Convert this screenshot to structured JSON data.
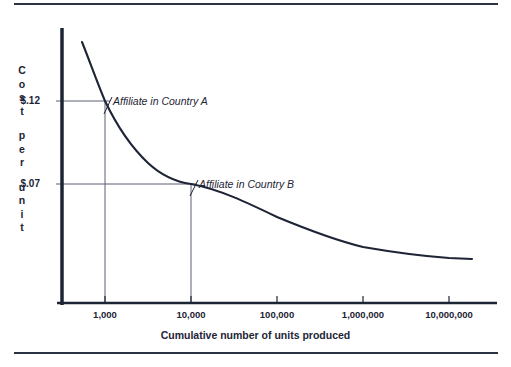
{
  "chart_data": {
    "type": "line",
    "title": "",
    "subtitle": "",
    "xlabel": "Cumulative number of units produced",
    "ylabel": "Cost per unit",
    "ylabel_stacked": [
      "Cost",
      "per",
      "unit"
    ],
    "xscale": "log",
    "x_tick_labels": [
      "1,000",
      "10,000",
      "100,000",
      "1,000,000",
      "10,000,000"
    ],
    "x_tick_values": [
      1000,
      10000,
      100000,
      1000000,
      10000000
    ],
    "y_tick_labels": [
      "$.12",
      "$.07"
    ],
    "y_tick_values": [
      0.12,
      0.07
    ],
    "xlim": [
      380,
      20000000
    ],
    "ylim": [
      0.0,
      0.2
    ],
    "grid": false,
    "legend": "none",
    "series": [
      {
        "name": "Experience curve",
        "color": "#1d2435",
        "points": [
          {
            "x": 500,
            "y": 0.182
          },
          {
            "x": 700,
            "y": 0.152
          },
          {
            "x": 1000,
            "y": 0.12
          },
          {
            "x": 2000,
            "y": 0.099
          },
          {
            "x": 4000,
            "y": 0.085
          },
          {
            "x": 10000,
            "y": 0.07
          },
          {
            "x": 30000,
            "y": 0.059
          },
          {
            "x": 100000,
            "y": 0.05
          },
          {
            "x": 300000,
            "y": 0.043
          },
          {
            "x": 1000000,
            "y": 0.037
          },
          {
            "x": 3000000,
            "y": 0.032
          },
          {
            "x": 10000000,
            "y": 0.028
          },
          {
            "x": 18000000,
            "y": 0.026
          }
        ]
      }
    ],
    "annotations": [
      {
        "label": "Affiliate in Country A",
        "x": 1000,
        "y": 0.12,
        "x_tick_label": "1,000",
        "y_tick_label": "$.12",
        "style": "italic"
      },
      {
        "label": "Affiliate in Country B",
        "x": 10000,
        "y": 0.07,
        "x_tick_label": "10,000",
        "y_tick_label": "$.07",
        "style": "italic"
      }
    ],
    "colors": {
      "axis": "#1d2435",
      "curve": "#1d2435",
      "guide_line": "#5a6070",
      "rule": "#2b3244",
      "text": "#1d2435",
      "background": "#ffffff"
    }
  }
}
